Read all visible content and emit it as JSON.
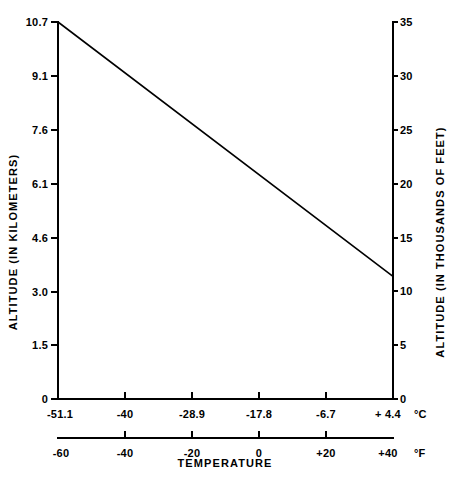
{
  "figure": {
    "background_color": "#ffffff",
    "ink_color": "#000000"
  },
  "axes": {
    "left": {
      "title": "ALTITUDE (IN KILOMETERS)",
      "ticks": [
        "0",
        "1.5",
        "3.0",
        "4.6",
        "6.1",
        "7.6",
        "9.1",
        "10.7"
      ]
    },
    "right": {
      "title": "ALTITUDE (IN THOUSANDS OF FEET)",
      "ticks": [
        "0",
        "5",
        "10",
        "15",
        "20",
        "25",
        "30",
        "35"
      ]
    },
    "celsius": {
      "unit": "°C",
      "ticks": [
        "-51.1",
        "-40",
        "-28.9",
        "-17.8",
        "-6.7",
        "+ 4.4"
      ]
    },
    "fahrenheit": {
      "unit": "°F",
      "ticks": [
        "-60",
        "-40",
        "-20",
        "0",
        "+20",
        "+40"
      ]
    },
    "bottom_title": "TEMPERATURE"
  },
  "chart_data": {
    "type": "line",
    "title": "",
    "subtitle": "",
    "xlabel": "TEMPERATURE",
    "ylabel": "ALTITUDE (IN KILOMETERS)",
    "ylabel_secondary": "ALTITUDE (IN THOUSANDS OF FEET)",
    "xlabel_unit_primary": "°C",
    "xlabel_unit_secondary": "°F",
    "grid": false,
    "legend": null,
    "xlim_celsius": [
      -51.1,
      4.4
    ],
    "xlim_fahrenheit": [
      -60,
      40
    ],
    "ylim_km": [
      0,
      10.7
    ],
    "ylim_kft": [
      0,
      35
    ],
    "xticks_celsius": [
      -51.1,
      -40,
      -28.9,
      -17.8,
      -6.7,
      4.4
    ],
    "xticks_fahrenheit": [
      -60,
      -40,
      -20,
      0,
      20,
      40
    ],
    "yticks_km": [
      0,
      1.5,
      3.0,
      4.6,
      6.1,
      7.6,
      9.1,
      10.7
    ],
    "yticks_kft": [
      0,
      5,
      10,
      15,
      20,
      25,
      30,
      35
    ],
    "series": [
      {
        "name": "Standard atmosphere temperature profile",
        "x_celsius": [
          -51.1,
          4.4
        ],
        "x_fahrenheit": [
          -60,
          40
        ],
        "y_km": [
          10.7,
          3.5
        ],
        "y_kft": [
          35,
          11.5
        ]
      }
    ]
  }
}
